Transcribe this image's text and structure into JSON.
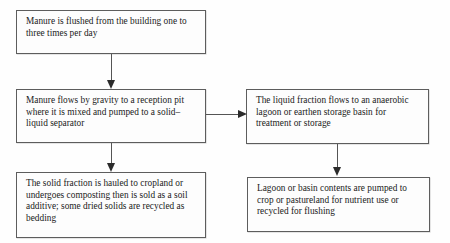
{
  "diagram": {
    "background_color": "#fefefe",
    "border_color": "#5d5d5d",
    "arrow_color": "#2b2b2b",
    "boxes": [
      {
        "id": "flush",
        "text": "Manure is flushed from the building one to three times per day"
      },
      {
        "id": "reception",
        "text": "Manure flows by gravity to a reception pit where it is mixed and pumped to a solid–liquid separator"
      },
      {
        "id": "solid",
        "text": "The solid fraction is hauled to cropland or undergoes composting then is sold as a soil additive; some dried solids are recycled as bedding"
      },
      {
        "id": "liquid",
        "text": "The liquid fraction flows to an anaerobic lagoon or earthen storage basin for treatment or storage"
      },
      {
        "id": "lagoon",
        "text": "Lagoon or basin contents are pumped to crop or pastureland for nutrient use or recycled for flushing"
      }
    ],
    "connectors": [
      {
        "id": "flush-reception",
        "from": "flush",
        "to": "reception",
        "direction": "down"
      },
      {
        "id": "reception-solid",
        "from": "reception",
        "to": "solid",
        "direction": "down"
      },
      {
        "id": "reception-liquid",
        "from": "reception",
        "to": "liquid",
        "direction": "right"
      },
      {
        "id": "liquid-lagoon",
        "from": "liquid",
        "to": "lagoon",
        "direction": "down"
      }
    ]
  }
}
